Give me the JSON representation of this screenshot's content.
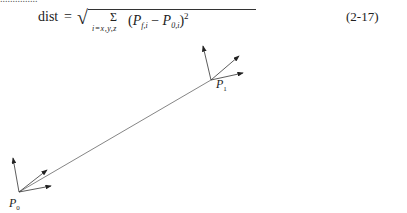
{
  "equation": {
    "lhs": "dist",
    "equals": "=",
    "sum_symbol": "Σ",
    "sum_subscript": "i=x,y,z",
    "term_open": "(",
    "term_a": "P",
    "term_a_sub": "f,i",
    "minus": " − ",
    "term_b": "P",
    "term_b_sub": "0,i",
    "term_close": ")",
    "exponent": "2",
    "number": "(2-17)"
  },
  "diagram": {
    "points": [
      {
        "label": "P",
        "sub": "0",
        "x": 19,
        "y": 192
      },
      {
        "label": "P",
        "sub": "1",
        "x": 211,
        "y": 80
      }
    ],
    "line_color": "#555555",
    "arrow_color": "#222222"
  }
}
